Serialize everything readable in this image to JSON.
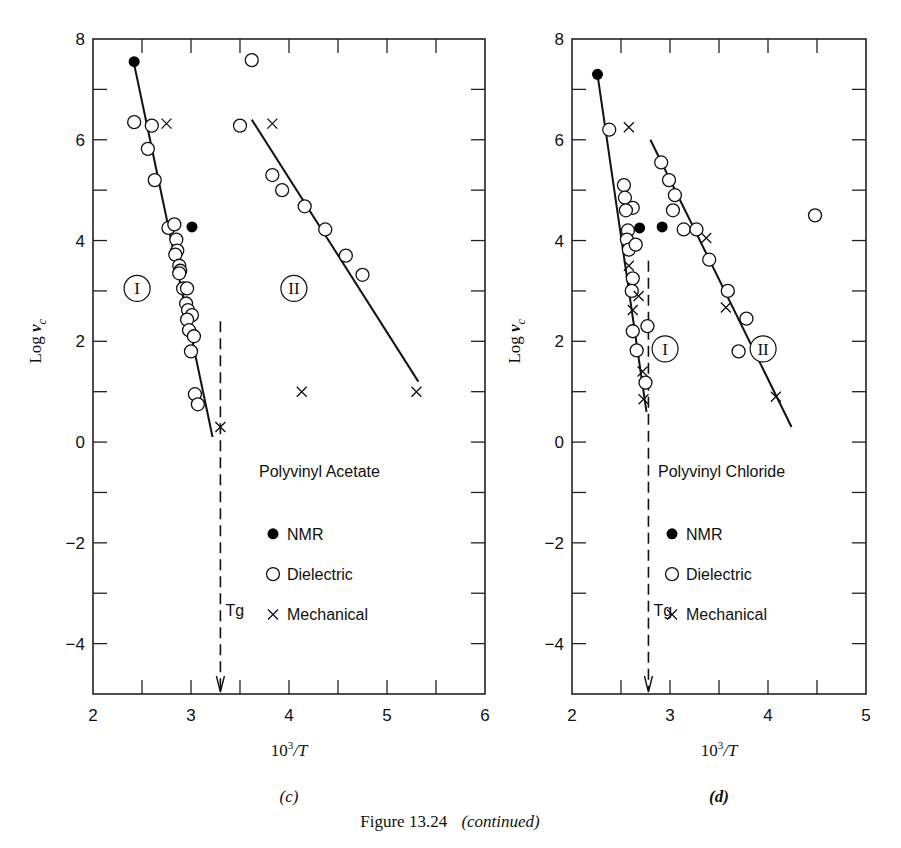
{
  "figure_caption": {
    "label": "Figure 13.24",
    "note": "(continued)"
  },
  "chart_data": [
    {
      "id": "c",
      "type": "scatter",
      "panel_label": "(c)",
      "title": "Polyvinyl Acetate",
      "xlabel": "10³/T",
      "ylabel": "Log ν_c",
      "xlim": [
        2,
        6
      ],
      "ylim": [
        -5,
        8
      ],
      "xticks": [
        2,
        3,
        4,
        5,
        6
      ],
      "yticks": [
        8,
        6,
        4,
        2,
        0,
        -2,
        -4
      ],
      "grid": false,
      "legend": [
        "NMR",
        "Dielectric",
        "Mechanical"
      ],
      "region_labels": [
        {
          "text": "I",
          "x": 2.45,
          "y": 3.05
        },
        {
          "text": "II",
          "x": 4.05,
          "y": 3.05
        }
      ],
      "tg": {
        "label": "Tg",
        "x": 3.3,
        "y_top": 2.4
      },
      "fit_lines": [
        {
          "name": "I",
          "x": [
            2.42,
            3.22
          ],
          "y": [
            7.5,
            0.1
          ]
        },
        {
          "name": "II",
          "x": [
            3.62,
            5.32
          ],
          "y": [
            6.4,
            1.2
          ]
        }
      ],
      "series": [
        {
          "name": "NMR",
          "marker": "filled-circle",
          "points": [
            [
              2.42,
              7.55
            ],
            [
              3.01,
              4.27
            ]
          ]
        },
        {
          "name": "Dielectric",
          "marker": "open-circle",
          "points": [
            [
              2.42,
              6.35
            ],
            [
              2.6,
              6.28
            ],
            [
              2.56,
              5.82
            ],
            [
              2.63,
              5.2
            ],
            [
              2.77,
              4.25
            ],
            [
              2.83,
              4.32
            ],
            [
              2.85,
              4.02
            ],
            [
              2.86,
              3.8
            ],
            [
              2.84,
              3.72
            ],
            [
              2.88,
              3.5
            ],
            [
              2.89,
              3.4
            ],
            [
              2.88,
              3.35
            ],
            [
              2.92,
              3.05
            ],
            [
              2.96,
              3.05
            ],
            [
              2.95,
              2.75
            ],
            [
              2.97,
              2.62
            ],
            [
              3.01,
              2.52
            ],
            [
              2.96,
              2.43
            ],
            [
              2.98,
              2.22
            ],
            [
              3.03,
              2.1
            ],
            [
              3.0,
              1.8
            ],
            [
              3.04,
              0.95
            ],
            [
              3.07,
              0.75
            ],
            [
              3.5,
              6.28
            ],
            [
              3.62,
              7.58
            ],
            [
              3.83,
              5.3
            ],
            [
              3.93,
              5.0
            ],
            [
              4.16,
              4.68
            ],
            [
              4.37,
              4.22
            ],
            [
              4.58,
              3.7
            ],
            [
              4.75,
              3.32
            ]
          ]
        },
        {
          "name": "Mechanical",
          "marker": "cross",
          "points": [
            [
              2.75,
              6.32
            ],
            [
              3.83,
              6.32
            ],
            [
              3.3,
              0.3
            ],
            [
              4.13,
              1.0
            ],
            [
              5.3,
              1.0
            ]
          ]
        }
      ]
    },
    {
      "id": "d",
      "type": "scatter",
      "panel_label": "(d)",
      "title": "Polyvinyl Chloride",
      "xlabel": "10³/T",
      "ylabel": "Log ν_c",
      "xlim": [
        2,
        5
      ],
      "ylim": [
        -5,
        8
      ],
      "xticks": [
        2,
        3,
        4,
        5
      ],
      "yticks": [
        8,
        6,
        4,
        2,
        0,
        -2,
        -4
      ],
      "grid": false,
      "legend": [
        "NMR",
        "Dielectric",
        "Mechanical"
      ],
      "region_labels": [
        {
          "text": "I",
          "x": 2.95,
          "y": 1.85
        },
        {
          "text": "II",
          "x": 3.95,
          "y": 1.85
        }
      ],
      "tg": {
        "label": "Tg",
        "x": 2.78,
        "y_top": 3.6
      },
      "fit_lines": [
        {
          "name": "I",
          "x": [
            2.26,
            2.76
          ],
          "y": [
            7.3,
            0.6
          ]
        },
        {
          "name": "II",
          "x": [
            2.8,
            4.24
          ],
          "y": [
            6.0,
            0.3
          ]
        }
      ],
      "series": [
        {
          "name": "NMR",
          "marker": "filled-circle",
          "points": [
            [
              2.26,
              7.3
            ],
            [
              2.69,
              4.25
            ],
            [
              2.92,
              4.27
            ]
          ]
        },
        {
          "name": "Dielectric",
          "marker": "open-circle",
          "points": [
            [
              2.38,
              6.2
            ],
            [
              2.53,
              5.1
            ],
            [
              2.54,
              4.85
            ],
            [
              2.62,
              4.65
            ],
            [
              2.55,
              4.6
            ],
            [
              2.57,
              4.2
            ],
            [
              2.56,
              4.02
            ],
            [
              2.58,
              3.82
            ],
            [
              2.65,
              3.92
            ],
            [
              2.62,
              3.25
            ],
            [
              2.61,
              3.0
            ],
            [
              2.62,
              2.2
            ],
            [
              2.66,
              1.82
            ],
            [
              2.75,
              1.18
            ],
            [
              2.77,
              2.3
            ],
            [
              2.91,
              5.55
            ],
            [
              2.99,
              5.2
            ],
            [
              3.05,
              4.9
            ],
            [
              3.03,
              4.6
            ],
            [
              3.14,
              4.22
            ],
            [
              3.27,
              4.22
            ],
            [
              3.4,
              3.62
            ],
            [
              3.59,
              3.0
            ],
            [
              3.78,
              2.45
            ],
            [
              3.7,
              1.8
            ],
            [
              4.48,
              4.5
            ]
          ]
        },
        {
          "name": "Mechanical",
          "marker": "cross",
          "points": [
            [
              2.58,
              6.25
            ],
            [
              2.58,
              3.5
            ],
            [
              2.68,
              2.9
            ],
            [
              2.62,
              2.62
            ],
            [
              2.72,
              1.4
            ],
            [
              2.73,
              0.85
            ],
            [
              3.37,
              4.05
            ],
            [
              3.57,
              2.67
            ],
            [
              4.08,
              0.9
            ]
          ]
        }
      ]
    }
  ]
}
